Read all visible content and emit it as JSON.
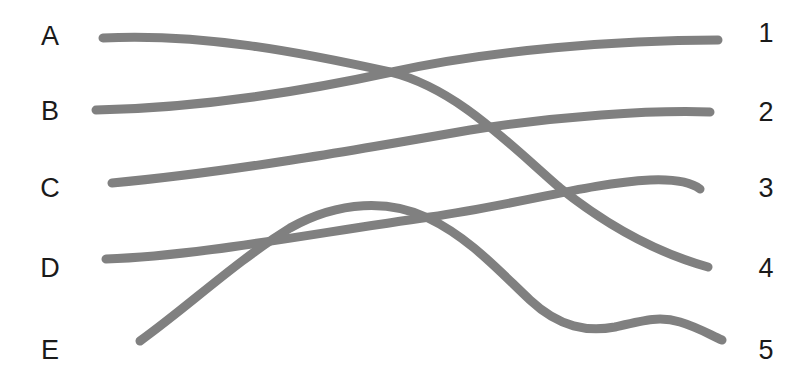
{
  "diagram": {
    "type": "matching-curves",
    "width": 810,
    "height": 382,
    "background_color": "#ffffff",
    "stroke_color": "#808080",
    "stroke_width": 9,
    "label_color": "#1a1a1a",
    "left_labels": [
      {
        "text": "A",
        "x": 50,
        "y": 36
      },
      {
        "text": "B",
        "x": 50,
        "y": 111
      },
      {
        "text": "C",
        "x": 50,
        "y": 188
      },
      {
        "text": "D",
        "x": 50,
        "y": 268
      },
      {
        "text": "E",
        "x": 50,
        "y": 350
      }
    ],
    "right_labels": [
      {
        "text": "1",
        "x": 766,
        "y": 33
      },
      {
        "text": "2",
        "x": 766,
        "y": 112
      },
      {
        "text": "3",
        "x": 766,
        "y": 188
      },
      {
        "text": "4",
        "x": 766,
        "y": 268
      },
      {
        "text": "5",
        "x": 766,
        "y": 350
      }
    ],
    "curves": [
      {
        "id": "curve-a",
        "from": "A",
        "to": "4",
        "start": [
          103,
          38
        ],
        "end": [
          708,
          267
        ],
        "path": "M 103 38 C 200 33, 300 52, 390 72 C 455 88, 505 140, 560 188 C 615 232, 665 255, 708 267"
      },
      {
        "id": "curve-b",
        "from": "B",
        "to": "1",
        "start": [
          96,
          110
        ],
        "end": [
          718,
          40
        ],
        "path": "M 96 110 C 200 108, 300 92, 392 72 C 490 50, 620 40, 718 40"
      },
      {
        "id": "curve-c",
        "from": "C",
        "to": "2",
        "start": [
          112,
          183
        ],
        "end": [
          710,
          112
        ],
        "path": "M 112 183 C 230 172, 350 151, 470 130 C 560 116, 650 110, 710 112"
      },
      {
        "id": "curve-d",
        "from": "D",
        "to": "3",
        "start": [
          106,
          259
        ],
        "end": [
          700,
          189
        ],
        "path": "M 106 259 C 200 256, 320 232, 430 217 C 520 204, 590 183, 650 180 C 675 179, 692 183, 700 189"
      },
      {
        "id": "curve-e",
        "from": "E",
        "to": "5",
        "start": [
          140,
          341
        ],
        "end": [
          722,
          340
        ],
        "path": "M 140 341 C 190 305, 235 262, 290 228 C 340 200, 390 200, 428 218 C 470 238, 500 272, 530 300 C 560 328, 588 332, 615 327 C 645 320, 660 316, 680 322 C 700 328, 712 336, 722 340"
      }
    ]
  }
}
